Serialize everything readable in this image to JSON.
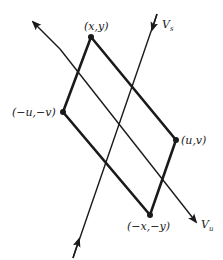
{
  "diagram": {
    "type": "phase-plane saddle symmetry",
    "colors": {
      "stroke": "#1a1a1a",
      "background": "#ffffff"
    },
    "points": [
      {
        "id": "p1",
        "label": "(x,y)"
      },
      {
        "id": "p2",
        "label": "(u,v)"
      },
      {
        "id": "p3",
        "label": "(−x,−y)"
      },
      {
        "id": "p4",
        "label": "(−u,−v)"
      }
    ],
    "manifolds": [
      {
        "id": "stable",
        "label_main": "V",
        "label_sub": "s"
      },
      {
        "id": "unstable",
        "label_main": "V",
        "label_sub": "u"
      }
    ]
  }
}
